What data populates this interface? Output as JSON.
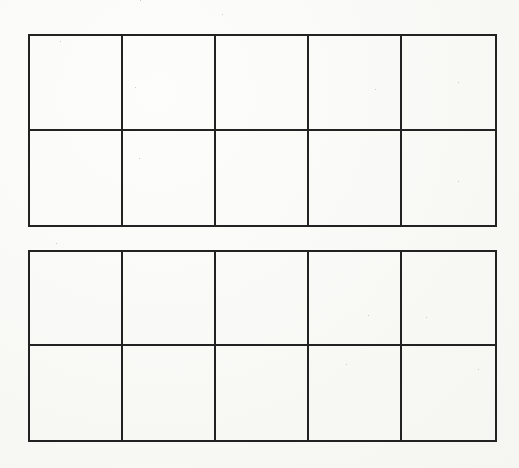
{
  "diagram": {
    "type": "ten-frames",
    "frame_count": 2,
    "frames": [
      {
        "id": "ten-frame-1",
        "rows": 2,
        "columns": 5,
        "cells": [
          {
            "row": 1,
            "col": 1,
            "filled": false
          },
          {
            "row": 1,
            "col": 2,
            "filled": false
          },
          {
            "row": 1,
            "col": 3,
            "filled": false
          },
          {
            "row": 1,
            "col": 4,
            "filled": false
          },
          {
            "row": 1,
            "col": 5,
            "filled": false
          },
          {
            "row": 2,
            "col": 1,
            "filled": false
          },
          {
            "row": 2,
            "col": 2,
            "filled": false
          },
          {
            "row": 2,
            "col": 3,
            "filled": false
          },
          {
            "row": 2,
            "col": 4,
            "filled": false
          },
          {
            "row": 2,
            "col": 5,
            "filled": false
          }
        ]
      },
      {
        "id": "ten-frame-2",
        "rows": 2,
        "columns": 5,
        "cells": [
          {
            "row": 1,
            "col": 1,
            "filled": false
          },
          {
            "row": 1,
            "col": 2,
            "filled": false
          },
          {
            "row": 1,
            "col": 3,
            "filled": false
          },
          {
            "row": 1,
            "col": 4,
            "filled": false
          },
          {
            "row": 1,
            "col": 5,
            "filled": false
          },
          {
            "row": 2,
            "col": 1,
            "filled": false
          },
          {
            "row": 2,
            "col": 2,
            "filled": false
          },
          {
            "row": 2,
            "col": 3,
            "filled": false
          },
          {
            "row": 2,
            "col": 4,
            "filled": false
          },
          {
            "row": 2,
            "col": 5,
            "filled": false
          }
        ]
      }
    ],
    "colors": {
      "line": "#222222",
      "background": "#fbfbf9"
    }
  }
}
